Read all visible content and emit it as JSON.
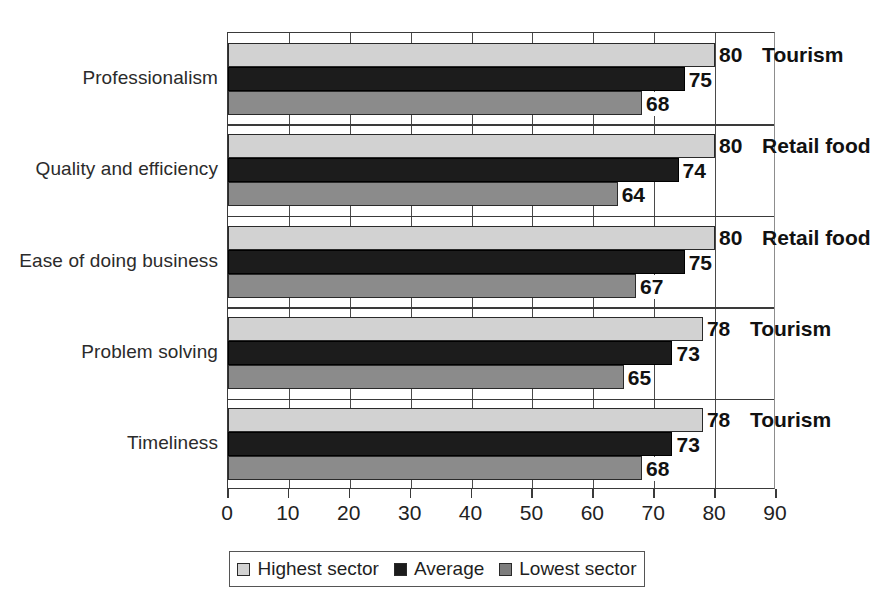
{
  "chart_data": {
    "type": "bar",
    "orientation": "horizontal",
    "title": "",
    "xlabel": "",
    "ylabel": "",
    "xlim": [
      0,
      90
    ],
    "xticks": [
      0,
      10,
      20,
      30,
      40,
      50,
      60,
      70,
      80,
      90
    ],
    "grid": true,
    "legend_position": "bottom",
    "categories": [
      "Professionalism",
      "Quality and efficiency",
      "Ease of doing business",
      "Problem solving",
      "Timeliness"
    ],
    "series": [
      {
        "name": "Highest sector",
        "color": "#d2d2d2",
        "values": [
          80,
          80,
          80,
          78,
          78
        ]
      },
      {
        "name": "Average",
        "color": "#1c1c1c",
        "values": [
          75,
          74,
          75,
          73,
          73
        ]
      },
      {
        "name": "Lowest sector",
        "color": "#8b8b8b",
        "values": [
          68,
          64,
          67,
          65,
          68
        ]
      }
    ],
    "annotations": [
      {
        "category": "Professionalism",
        "value": 80,
        "sector": "Tourism"
      },
      {
        "category": "Quality and efficiency",
        "value": 80,
        "sector": "Retail food"
      },
      {
        "category": "Ease of doing business",
        "value": 80,
        "sector": "Retail food"
      },
      {
        "category": "Problem solving",
        "value": 78,
        "sector": "Tourism"
      },
      {
        "category": "Timeliness",
        "value": 78,
        "sector": "Tourism"
      }
    ]
  },
  "legend": {
    "items": [
      {
        "label": "Highest sector",
        "swatch": "legend-swatch-highest"
      },
      {
        "label": "Average",
        "swatch": "legend-swatch-average"
      },
      {
        "label": "Lowest sector",
        "swatch": "legend-swatch-lowest"
      }
    ]
  }
}
